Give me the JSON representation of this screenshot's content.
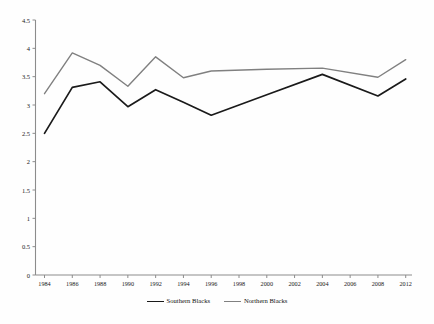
{
  "chart_data": {
    "type": "line",
    "title": "",
    "subtitle": "",
    "xlabel": "",
    "ylabel": "",
    "grid": false,
    "legend_position": "bottom-center",
    "ylim": [
      0,
      4.5
    ],
    "xlim": [
      1984,
      2012
    ],
    "yticks": [
      "0",
      "0.5",
      "1",
      "1.5",
      "2",
      "2.5",
      "3",
      "3.5",
      "4",
      "4.5"
    ],
    "ytick_values": [
      0,
      0.5,
      1,
      1.5,
      2,
      2.5,
      3,
      3.5,
      4,
      4.5
    ],
    "xticks": [
      "1984",
      "1986",
      "1988",
      "1990",
      "1992",
      "1994",
      "1996",
      "1998",
      "2000",
      "2002",
      "2004",
      "2006",
      "2008",
      "2012"
    ],
    "xtick_values": [
      1984,
      1986,
      1988,
      1990,
      1992,
      1994,
      1996,
      1998,
      2000,
      2002,
      2004,
      2006,
      2008,
      2012
    ],
    "x": [
      1984,
      1986,
      1988,
      1990,
      1992,
      1994,
      1996,
      2000,
      2004,
      2008,
      2012
    ],
    "series": [
      {
        "name": "Southern Blacks",
        "color": "#1a1a1a",
        "x": [
          1984,
          1986,
          1988,
          1990,
          1992,
          1994,
          1996,
          2000,
          2004,
          2008,
          2012
        ],
        "values": [
          2.5,
          3.31,
          3.41,
          2.97,
          3.27,
          3.05,
          2.82,
          3.18,
          3.54,
          3.16,
          3.46
        ]
      },
      {
        "name": "Northern Blacks",
        "color": "#808080",
        "x": [
          1984,
          1986,
          1988,
          1990,
          1992,
          1994,
          1996,
          2000,
          2004,
          2008,
          2012
        ],
        "values": [
          3.2,
          3.92,
          3.7,
          3.33,
          3.85,
          3.48,
          3.6,
          3.63,
          3.65,
          3.49,
          3.8
        ]
      }
    ]
  },
  "legend": {
    "items": [
      {
        "label": "Southern Blacks",
        "color": "#1a1a1a"
      },
      {
        "label": "Northern Blacks",
        "color": "#808080"
      }
    ]
  },
  "axes": {
    "axis_color": "#8c8c8c"
  }
}
